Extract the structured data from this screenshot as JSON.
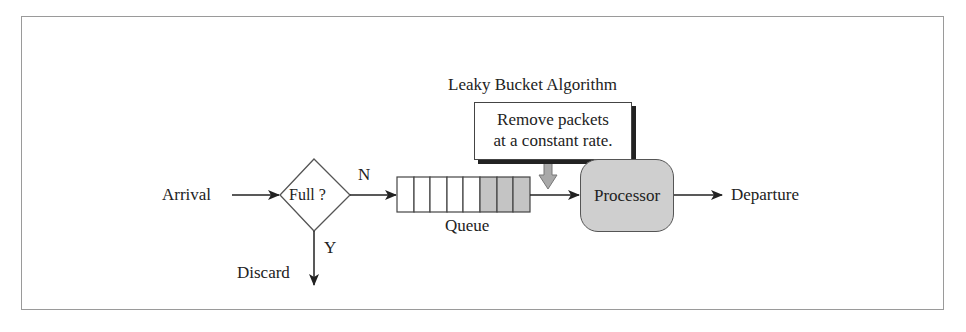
{
  "diagram": {
    "title": "Leaky Bucket Algorithm",
    "note": {
      "line1": "Remove packets",
      "line2": "at a constant rate."
    },
    "nodes": {
      "arrival": "Arrival",
      "decision": "Full ?",
      "queue": "Queue",
      "processor": "Processor",
      "departure": "Departure",
      "discard": "Discard"
    },
    "edges": {
      "no_label": "N",
      "yes_label": "Y"
    },
    "queue": {
      "total_slots": 8,
      "filled_slots": 3,
      "empty_color": "#ffffff",
      "filled_color": "#c4c4c4"
    },
    "colors": {
      "processor_fill": "#cfcfcf",
      "arrow_down_fill": "#a9a9a9",
      "frame_border": "#9a9a9a"
    }
  }
}
